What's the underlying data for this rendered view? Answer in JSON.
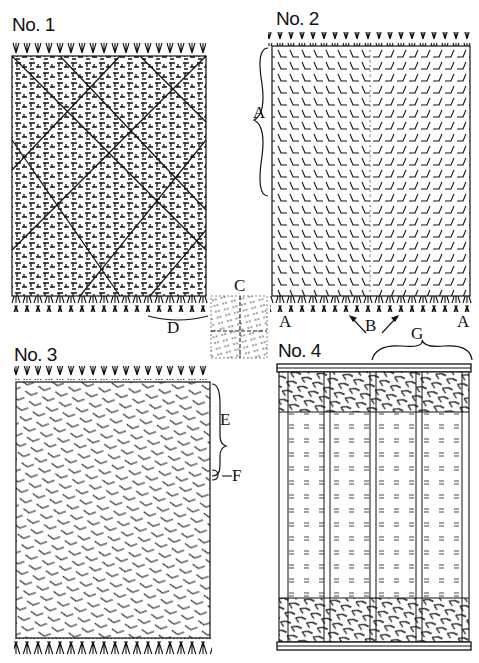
{
  "figures": [
    {
      "id": "no1",
      "label": "No. 1",
      "description": "Blanket with diagonal lattice pattern and fringed ends"
    },
    {
      "id": "no2",
      "label": "No. 2",
      "description": "Blanket with chevron herringbone pattern converging to center"
    },
    {
      "id": "no3",
      "label": "No. 3",
      "description": "Blanket with diagonal herringbone stripes"
    },
    {
      "id": "no4",
      "label": "No. 4",
      "description": "Blanket with vertical striped panels and feathered end borders"
    }
  ],
  "center_detail": {
    "label": "C",
    "description": "Detail square of weave with crossing center lines"
  },
  "annotations": {
    "a_top": "A",
    "a_bottom_left": "A",
    "a_bottom_right": "A",
    "b": "B",
    "d": "D",
    "e": "E",
    "f": "F",
    "g": "G"
  },
  "colors": {
    "ink": "#111111",
    "paper": "#ffffff"
  }
}
